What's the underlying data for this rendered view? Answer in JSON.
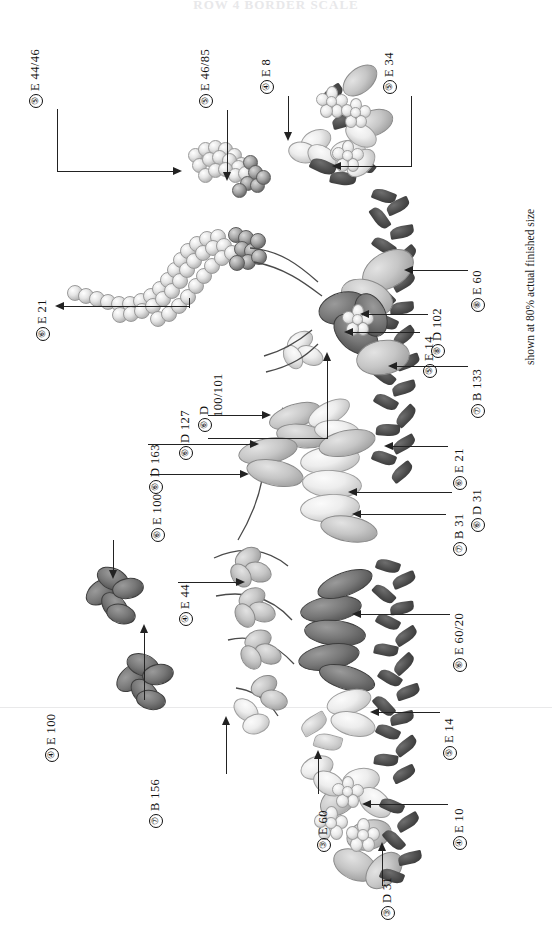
{
  "document": {
    "title": "ROW 4  BORDER SCALE",
    "footer_note": "shown at 80% actual finished size",
    "kind": "embroidery-stitch-placement-diagram"
  },
  "labels": [
    {
      "id": "l1",
      "num": "5",
      "code": "E 44/46",
      "text": "⓪ E 44/46"
    },
    {
      "id": "l2",
      "num": "5",
      "code": "E 46/85",
      "text": "⓪ E 46/85"
    },
    {
      "id": "l3",
      "num": "4",
      "code": "E 8",
      "text": "⓪ E 8"
    },
    {
      "id": "l4",
      "num": "5",
      "code": "E 34",
      "text": "⓪ E 34"
    },
    {
      "id": "l5",
      "num": "6",
      "code": "E 21",
      "text": "⓪ E 21"
    },
    {
      "id": "l6",
      "num": "8",
      "code": "E 60",
      "text": "⓪ E 60"
    },
    {
      "id": "l7",
      "num": "8",
      "code": "D 102",
      "text": "⓪ D 102"
    },
    {
      "id": "l8",
      "num": "5",
      "code": "E 14",
      "text": "⓪ E 14"
    },
    {
      "id": "l9",
      "num": "7",
      "code": "B 133",
      "text": "⓪ B 133"
    },
    {
      "id": "l10",
      "num": "6",
      "code": "D 127",
      "text": "⓪ D 127"
    },
    {
      "id": "l11",
      "num": "6",
      "code": "D 100/101",
      "text": "⓪ D 100/101",
      "line1": "D",
      "line2": "100/101"
    },
    {
      "id": "l12",
      "num": "6",
      "code": "D 163",
      "text": "⓪ D 163"
    },
    {
      "id": "l13",
      "num": "6",
      "code": "E 21",
      "text": "⓪ E 21"
    },
    {
      "id": "l14",
      "num": "6",
      "code": "D 31",
      "text": "⓪ D 31"
    },
    {
      "id": "l15",
      "num": "7",
      "code": "B 31",
      "text": "⓪ B 31"
    },
    {
      "id": "l16",
      "num": "6",
      "code": "E 100",
      "text": "⓪ E 100"
    },
    {
      "id": "l17",
      "num": "4",
      "code": "E 44",
      "text": "⓪ E 44"
    },
    {
      "id": "l18",
      "num": "6",
      "code": "E 60/20",
      "text": "⓪ E 60/20"
    },
    {
      "id": "l19",
      "num": "4",
      "code": "E 100",
      "text": "⓪ E 100"
    },
    {
      "id": "l20",
      "num": "7",
      "code": "B 156",
      "text": "⓪ B 156"
    },
    {
      "id": "l21",
      "num": "5",
      "code": "E 14",
      "text": "⓪ E 14"
    },
    {
      "id": "l22",
      "num": "3",
      "code": "E 60",
      "text": "⓪ E 60"
    },
    {
      "id": "l23",
      "num": "4",
      "code": "E 10",
      "text": "⓪ E 10"
    },
    {
      "id": "l24",
      "num": "3",
      "code": "D 31",
      "text": "⓪ D 31"
    }
  ],
  "label_text": {
    "l1": "E 44/46",
    "l1n": "⑤",
    "l2": "E 46/85",
    "l2n": "⑤",
    "l3": "E 8",
    "l3n": "④",
    "l4": "E 34",
    "l4n": "⑤",
    "l5": "E 21",
    "l5n": "⑥",
    "l6": "E 60",
    "l6n": "⑧",
    "l7": "D 102",
    "l7n": "⑧",
    "l8": "E 14",
    "l8n": "⑤",
    "l9": "B 133",
    "l9n": "⑦",
    "l10": "D 127",
    "l10n": "⑥",
    "l11": "D",
    "l11b": "100/101",
    "l11n": "⑥",
    "l12": "D 163",
    "l12n": "⑥",
    "l13": "E 21",
    "l13n": "⑥",
    "l14": "D 31",
    "l14n": "⑥",
    "l15": "B 31",
    "l15n": "⑦",
    "l16": "E 100",
    "l16n": "⑥",
    "l17": "E 44",
    "l17n": "④",
    "l18": "E 60/20",
    "l18n": "⑥",
    "l19": "E 100",
    "l19n": "④",
    "l20": "B 156",
    "l20n": "⑦",
    "l21": "E 14",
    "l21n": "⑤",
    "l22": "E 60",
    "l22n": "③",
    "l23": "E 10",
    "l23n": "④",
    "l24": "D 31",
    "l24n": "③"
  },
  "colors": {
    "ink": "#1a1a1a",
    "leader": "#222222",
    "background": "#ffffff",
    "title_ghost": "#e8e8ea",
    "dark_leaf": "#2e2e2e",
    "mid_gray": "#9d9d9d",
    "light_gray": "#ededed"
  }
}
